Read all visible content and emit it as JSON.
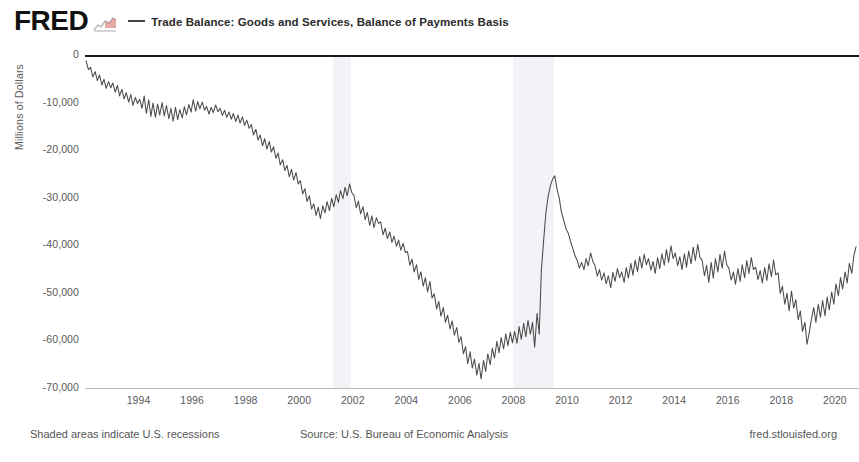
{
  "header": {
    "logo_text": "FRED",
    "logo_mark_icon": "fred-squiggle-icon",
    "legend_dash_icon": "legend-line-icon",
    "series_label": "Trade Balance: Goods and Services, Balance of Payments Basis"
  },
  "footer": {
    "recession_note": "Shaded areas indicate U.S. recessions",
    "source": "Source: U.S. Bureau of Economic Analysis",
    "url": "fred.stlouisfed.org"
  },
  "chart_data": {
    "type": "line",
    "title": "Trade Balance: Goods and Services, Balance of Payments Basis",
    "xlabel": "",
    "ylabel": "Millions of Dollars",
    "xlim": [
      1992.0,
      2020.9
    ],
    "ylim": [
      -70000,
      0
    ],
    "grid": false,
    "legend_position": "top",
    "line_color": "#4b4b4b",
    "zero_line_color": "#1a1a1a",
    "recession_band_color": "#eceff3",
    "y_ticks": [
      0,
      -10000,
      -20000,
      -30000,
      -40000,
      -50000,
      -60000,
      -70000
    ],
    "y_tick_labels": [
      "0",
      "-10,000",
      "-20,000",
      "-30,000",
      "-40,000",
      "-50,000",
      "-60,000",
      "-70,000"
    ],
    "x_ticks": [
      1994,
      1996,
      1998,
      2000,
      2002,
      2004,
      2006,
      2008,
      2010,
      2012,
      2014,
      2016,
      2018,
      2020
    ],
    "x_tick_labels": [
      "1994",
      "1996",
      "1998",
      "2000",
      "2002",
      "2004",
      "2006",
      "2008",
      "2010",
      "2012",
      "2014",
      "2016",
      "2018",
      "2020"
    ],
    "recessions": [
      {
        "start": 2001.25,
        "end": 2001.92
      },
      {
        "start": 2007.99,
        "end": 2009.5
      }
    ],
    "series": [
      {
        "name": "Trade Balance: Goods and Services, Balance of Payments Basis",
        "units": "Millions of Dollars",
        "frequency": "Monthly",
        "x": [
          1992.04,
          1992.13,
          1992.21,
          1992.29,
          1992.38,
          1992.46,
          1992.54,
          1992.63,
          1992.71,
          1992.79,
          1992.88,
          1992.96,
          1993.04,
          1993.13,
          1993.21,
          1993.29,
          1993.38,
          1993.46,
          1993.54,
          1993.63,
          1993.71,
          1993.79,
          1993.88,
          1993.96,
          1994.04,
          1994.13,
          1994.21,
          1994.29,
          1994.38,
          1994.46,
          1994.54,
          1994.63,
          1994.71,
          1994.79,
          1994.88,
          1994.96,
          1995.04,
          1995.13,
          1995.21,
          1995.29,
          1995.38,
          1995.46,
          1995.54,
          1995.63,
          1995.71,
          1995.79,
          1995.88,
          1995.96,
          1996.04,
          1996.13,
          1996.21,
          1996.29,
          1996.38,
          1996.46,
          1996.54,
          1996.63,
          1996.71,
          1996.79,
          1996.88,
          1996.96,
          1997.04,
          1997.13,
          1997.21,
          1997.29,
          1997.38,
          1997.46,
          1997.54,
          1997.63,
          1997.71,
          1997.79,
          1997.88,
          1997.96,
          1998.04,
          1998.13,
          1998.21,
          1998.29,
          1998.38,
          1998.46,
          1998.54,
          1998.63,
          1998.71,
          1998.79,
          1998.88,
          1998.96,
          1999.04,
          1999.13,
          1999.21,
          1999.29,
          1999.38,
          1999.46,
          1999.54,
          1999.63,
          1999.71,
          1999.79,
          1999.88,
          1999.96,
          2000.04,
          2000.13,
          2000.21,
          2000.29,
          2000.38,
          2000.46,
          2000.54,
          2000.63,
          2000.71,
          2000.79,
          2000.88,
          2000.96,
          2001.04,
          2001.13,
          2001.21,
          2001.29,
          2001.38,
          2001.46,
          2001.54,
          2001.63,
          2001.71,
          2001.79,
          2001.88,
          2001.96,
          2002.04,
          2002.13,
          2002.21,
          2002.29,
          2002.38,
          2002.46,
          2002.54,
          2002.63,
          2002.71,
          2002.79,
          2002.88,
          2002.96,
          2003.04,
          2003.13,
          2003.21,
          2003.29,
          2003.38,
          2003.46,
          2003.54,
          2003.63,
          2003.71,
          2003.79,
          2003.88,
          2003.96,
          2004.04,
          2004.13,
          2004.21,
          2004.29,
          2004.38,
          2004.46,
          2004.54,
          2004.63,
          2004.71,
          2004.79,
          2004.88,
          2004.96,
          2005.04,
          2005.13,
          2005.21,
          2005.29,
          2005.38,
          2005.46,
          2005.54,
          2005.63,
          2005.71,
          2005.79,
          2005.88,
          2005.96,
          2006.04,
          2006.13,
          2006.21,
          2006.29,
          2006.38,
          2006.46,
          2006.54,
          2006.63,
          2006.71,
          2006.79,
          2006.88,
          2006.96,
          2007.04,
          2007.13,
          2007.21,
          2007.29,
          2007.38,
          2007.46,
          2007.54,
          2007.63,
          2007.71,
          2007.79,
          2007.88,
          2007.96,
          2008.04,
          2008.13,
          2008.21,
          2008.29,
          2008.38,
          2008.46,
          2008.54,
          2008.63,
          2008.71,
          2008.79,
          2008.88,
          2008.96,
          2009.04,
          2009.13,
          2009.21,
          2009.29,
          2009.38,
          2009.46,
          2009.54,
          2009.63,
          2009.71,
          2009.79,
          2009.88,
          2009.96,
          2010.04,
          2010.13,
          2010.21,
          2010.29,
          2010.38,
          2010.46,
          2010.54,
          2010.63,
          2010.71,
          2010.79,
          2010.88,
          2010.96,
          2011.04,
          2011.13,
          2011.21,
          2011.29,
          2011.38,
          2011.46,
          2011.54,
          2011.63,
          2011.71,
          2011.79,
          2011.88,
          2011.96,
          2012.04,
          2012.13,
          2012.21,
          2012.29,
          2012.38,
          2012.46,
          2012.54,
          2012.63,
          2012.71,
          2012.79,
          2012.88,
          2012.96,
          2013.04,
          2013.13,
          2013.21,
          2013.29,
          2013.38,
          2013.46,
          2013.54,
          2013.63,
          2013.71,
          2013.79,
          2013.88,
          2013.96,
          2014.04,
          2014.13,
          2014.21,
          2014.29,
          2014.38,
          2014.46,
          2014.54,
          2014.63,
          2014.71,
          2014.79,
          2014.88,
          2014.96,
          2015.04,
          2015.13,
          2015.21,
          2015.29,
          2015.38,
          2015.46,
          2015.54,
          2015.63,
          2015.71,
          2015.79,
          2015.88,
          2015.96,
          2016.04,
          2016.13,
          2016.21,
          2016.29,
          2016.38,
          2016.46,
          2016.54,
          2016.63,
          2016.71,
          2016.79,
          2016.88,
          2016.96,
          2017.04,
          2017.13,
          2017.21,
          2017.29,
          2017.38,
          2017.46,
          2017.54,
          2017.63,
          2017.71,
          2017.79,
          2017.88,
          2017.96,
          2018.04,
          2018.13,
          2018.21,
          2018.29,
          2018.38,
          2018.46,
          2018.54,
          2018.63,
          2018.71,
          2018.79,
          2018.88,
          2018.96,
          2019.04,
          2019.13,
          2019.21,
          2019.29,
          2019.38,
          2019.46,
          2019.54,
          2019.63,
          2019.71,
          2019.79,
          2019.88,
          2019.96,
          2020.04,
          2020.13,
          2020.21,
          2020.29,
          2020.38,
          2020.46,
          2020.54,
          2020.63,
          2020.71,
          2020.79
        ],
        "y": [
          -1200,
          -3100,
          -2600,
          -4600,
          -3500,
          -5400,
          -4200,
          -6300,
          -5100,
          -7000,
          -5600,
          -6900,
          -5900,
          -7800,
          -6400,
          -8600,
          -7200,
          -9200,
          -7900,
          -9900,
          -8300,
          -10600,
          -8900,
          -10200,
          -9300,
          -11200,
          -8600,
          -12300,
          -9400,
          -12900,
          -10100,
          -13100,
          -10300,
          -12600,
          -10000,
          -12800,
          -10600,
          -13400,
          -11200,
          -13900,
          -11000,
          -13600,
          -11500,
          -13200,
          -10900,
          -12600,
          -10400,
          -12000,
          -9400,
          -11800,
          -9800,
          -11300,
          -9900,
          -11600,
          -10800,
          -12400,
          -11000,
          -12100,
          -10500,
          -11900,
          -11200,
          -12700,
          -11600,
          -13100,
          -12000,
          -13500,
          -12300,
          -14000,
          -12600,
          -14300,
          -13000,
          -14800,
          -13700,
          -15400,
          -14600,
          -16800,
          -15600,
          -17900,
          -16800,
          -19100,
          -17600,
          -19800,
          -18200,
          -20400,
          -19300,
          -21700,
          -20600,
          -23100,
          -22000,
          -24300,
          -23200,
          -25600,
          -24000,
          -26300,
          -24700,
          -27100,
          -26400,
          -29200,
          -28100,
          -30800,
          -29600,
          -32400,
          -31300,
          -33700,
          -32000,
          -34400,
          -31700,
          -33200,
          -30800,
          -32700,
          -30100,
          -31900,
          -29400,
          -31000,
          -28500,
          -30200,
          -27800,
          -29600,
          -27100,
          -28900,
          -29500,
          -32100,
          -30700,
          -33400,
          -31900,
          -34600,
          -33100,
          -35800,
          -33800,
          -36300,
          -34200,
          -35400,
          -35100,
          -37800,
          -36400,
          -38600,
          -37200,
          -39400,
          -38100,
          -40200,
          -38900,
          -41000,
          -39600,
          -41500,
          -41300,
          -44200,
          -42900,
          -45600,
          -44100,
          -47200,
          -45600,
          -48600,
          -46800,
          -49800,
          -47600,
          -51100,
          -50200,
          -53400,
          -51800,
          -54900,
          -53100,
          -56200,
          -54700,
          -57600,
          -55900,
          -58900,
          -57300,
          -60400,
          -59200,
          -62800,
          -61300,
          -64900,
          -62400,
          -65800,
          -63900,
          -67300,
          -64800,
          -68100,
          -64200,
          -66500,
          -62800,
          -65100,
          -61600,
          -63700,
          -60200,
          -62600,
          -59400,
          -61800,
          -58600,
          -61100,
          -58300,
          -60500,
          -58100,
          -60600,
          -57100,
          -59800,
          -56400,
          -59200,
          -55800,
          -58700,
          -56200,
          -61400,
          -54300,
          -58700,
          -45200,
          -38600,
          -33100,
          -29800,
          -27400,
          -26100,
          -25400,
          -28300,
          -30200,
          -33100,
          -34800,
          -36600,
          -37400,
          -39200,
          -40600,
          -42100,
          -43200,
          -44800,
          -43600,
          -45100,
          -42800,
          -44300,
          -41600,
          -43400,
          -44200,
          -46500,
          -45100,
          -47300,
          -45800,
          -48100,
          -46400,
          -48900,
          -45700,
          -47600,
          -44900,
          -46800,
          -45600,
          -47800,
          -44700,
          -46900,
          -43800,
          -46300,
          -43100,
          -45500,
          -42400,
          -44800,
          -41900,
          -44100,
          -42800,
          -45200,
          -43400,
          -45900,
          -42600,
          -44900,
          -41800,
          -44200,
          -40900,
          -43600,
          -40100,
          -42800,
          -41600,
          -44300,
          -42400,
          -45100,
          -41800,
          -44600,
          -41200,
          -43900,
          -40400,
          -43200,
          -39800,
          -42600,
          -43100,
          -46400,
          -44200,
          -47800,
          -43600,
          -46900,
          -42800,
          -45600,
          -41900,
          -44800,
          -41200,
          -44100,
          -44800,
          -47300,
          -45600,
          -48200,
          -44900,
          -47600,
          -44100,
          -46800,
          -43200,
          -45900,
          -42600,
          -45100,
          -44600,
          -47200,
          -45300,
          -47900,
          -44700,
          -47400,
          -43900,
          -46600,
          -43100,
          -46200,
          -45800,
          -50100,
          -48600,
          -52400,
          -50100,
          -53800,
          -49600,
          -53200,
          -51400,
          -55600,
          -53800,
          -58100,
          -56200,
          -60800,
          -58400,
          -55300,
          -53100,
          -56200,
          -52400,
          -55100,
          -51600,
          -54800,
          -50900,
          -53600,
          -49800,
          -52400,
          -48100,
          -50600,
          -46800,
          -49200,
          -45600,
          -47900,
          -43800,
          -45900,
          -42100,
          -40300
        ]
      }
    ]
  },
  "y_axis": {
    "title": "Millions of Dollars"
  }
}
